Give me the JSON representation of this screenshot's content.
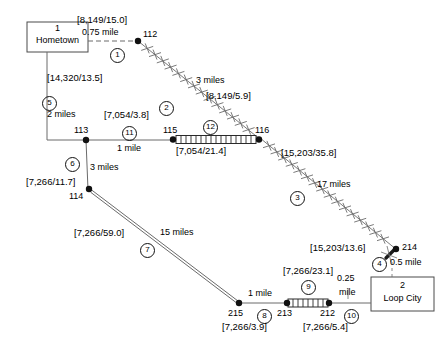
{
  "diagram": {
    "cities": [
      {
        "id": "hometown",
        "num": "1",
        "name": "Hometown"
      },
      {
        "id": "loopcity",
        "num": "2",
        "name": "Loop City"
      }
    ],
    "nodes": [
      {
        "id": "n112",
        "label": "112",
        "x": 138,
        "y": 40
      },
      {
        "id": "n113",
        "label": "113",
        "x": 86,
        "y": 140
      },
      {
        "id": "n115",
        "label": "115",
        "x": 172,
        "y": 140
      },
      {
        "id": "n116",
        "label": "116",
        "x": 260,
        "y": 138
      },
      {
        "id": "n114",
        "label": "114",
        "x": 88,
        "y": 190
      },
      {
        "id": "n214",
        "label": "214",
        "x": 396,
        "y": 249
      },
      {
        "id": "n215",
        "label": "215",
        "x": 237,
        "y": 303
      },
      {
        "id": "n213",
        "label": "213",
        "x": 285,
        "y": 303
      },
      {
        "id": "n212",
        "label": "212",
        "x": 330,
        "y": 303
      }
    ],
    "links": [
      {
        "num": "1",
        "style": "dashed",
        "distance": "0.75 mile",
        "bracket": "[8,149/15.0]"
      },
      {
        "num": "2",
        "style": "railroad",
        "distance": "3 miles",
        "bracket": "[8,149/5.9]"
      },
      {
        "num": "3",
        "style": "railroad",
        "distance": "17 miles",
        "bracket": "[15,203/35.8]"
      },
      {
        "num": "4",
        "style": "railroad-stub",
        "distance": "0.5 mile",
        "bracket": "[15,203/13.6]"
      },
      {
        "num": "5",
        "style": "plain",
        "distance": "2 miles",
        "bracket": "[14,320/13.5]"
      },
      {
        "num": "6",
        "style": "plain",
        "distance": "3 miles",
        "bracket": "[7,266/11.7]"
      },
      {
        "num": "7",
        "style": "double",
        "distance": "15 miles",
        "bracket": "[7,266/59.0]"
      },
      {
        "num": "8",
        "style": "plain",
        "distance": "1 mile",
        "bracket": "[7,266/3.9]"
      },
      {
        "num": "9",
        "style": "hatched",
        "distance": "",
        "bracket": "[7,266/23.1]"
      },
      {
        "num": "10",
        "style": "plain",
        "distance": "0.25 mile",
        "bracket": "[7,266/5.4]"
      },
      {
        "num": "11",
        "style": "plain",
        "distance": "1 mile",
        "bracket": "[7,054/3.8]"
      },
      {
        "num": "12",
        "style": "hatched",
        "distance": "",
        "bracket": "[7,054/21.4]"
      }
    ],
    "labels": {
      "b_8149_150": "[8,149/15.0]",
      "d_075_mile": "0.75 mile",
      "b_14320_135": "[14,320/13.5]",
      "d_2_miles": "2 miles",
      "d_3_miles_link2": "3 miles",
      "b_8149_59": "[8,149/5.9]",
      "b_7054_38": "[7,054/3.8]",
      "d_1_mile_link11": "1 mile",
      "b_7054_214": "[7,054/21.4]",
      "b_15203_358": "[15,203/35.8]",
      "d_17_miles": "17 miles",
      "b_7266_117": "[7,266/11.7]",
      "d_3_miles_link6": "3 miles",
      "b_7266_590": "[7,266/59.0]",
      "d_15_miles": "15 miles",
      "b_15203_136": "[15,203/13.6]",
      "d_05_mile": "0.5 mile",
      "b_7266_231": "[7,266/23.1]",
      "d_025_mile_a": "0.25",
      "d_025_mile_b": "mile",
      "d_1_mile_link8": "1 mile",
      "b_7266_39": "[7,266/3.9]",
      "b_7266_54": "[7,266/5.4]"
    },
    "colors": {
      "ink": "#000000",
      "line": "#555555",
      "paper": "#ffffff"
    }
  }
}
